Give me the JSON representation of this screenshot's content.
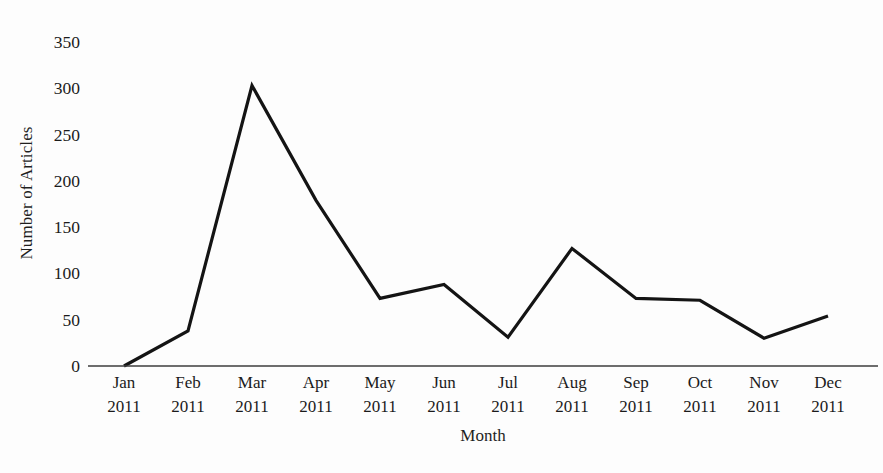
{
  "chart_data": {
    "type": "line",
    "title": "",
    "xlabel": "Month",
    "ylabel": "Number of Articles",
    "categories": [
      "Jan\n2011",
      "Feb\n2011",
      "Mar\n2011",
      "Apr\n2011",
      "May\n2011",
      "Jun\n2011",
      "Jul\n2011",
      "Aug\n2011",
      "Sep\n2011",
      "Oct\n2011",
      "Nov\n2011",
      "Dec\n2011"
    ],
    "x_tick_months": [
      "Jan",
      "Feb",
      "Mar",
      "Apr",
      "May",
      "Jun",
      "Jul",
      "Aug",
      "Sep",
      "Oct",
      "Nov",
      "Dec"
    ],
    "x_tick_years": [
      "2011",
      "2011",
      "2011",
      "2011",
      "2011",
      "2011",
      "2011",
      "2011",
      "2011",
      "2011",
      "2011",
      "2011"
    ],
    "values": [
      0,
      38,
      303,
      179,
      73,
      88,
      31,
      127,
      73,
      71,
      30,
      54
    ],
    "series": [
      {
        "name": "Number of Articles",
        "values": [
          0,
          38,
          303,
          179,
          73,
          88,
          31,
          127,
          73,
          71,
          30,
          54
        ],
        "color": "#141414"
      }
    ],
    "ylim": [
      0,
      350
    ],
    "y_ticks": [
      0,
      50,
      100,
      150,
      200,
      250,
      300,
      350
    ],
    "y_tick_labels": [
      "0",
      "50",
      "100",
      "150",
      "200",
      "250",
      "300",
      "350"
    ],
    "xlim_categories": [
      0,
      11
    ],
    "grid": false,
    "legend": "none",
    "line_color": "#141414",
    "axis_color": "#3d3d3d",
    "background_color": "#fdfdfd",
    "text_color": "#1b1b1b"
  }
}
